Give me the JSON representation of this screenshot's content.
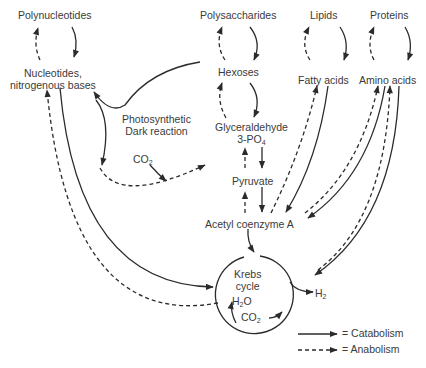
{
  "nodes": {
    "polynucleotides": "Polynucleotides",
    "nucleotides_1": "Nucleotides,",
    "nucleotides_2": "nitrogenous bases",
    "photosynthetic_1": "Photosynthetic",
    "photosynthetic_2": "Dark reaction",
    "co2_left": "CO",
    "co2_left_sub": "2",
    "polysaccharides": "Polysaccharides",
    "lipids": "Lipids",
    "proteins": "Proteins",
    "hexoses": "Hexoses",
    "fatty_acids": "Fatty acids",
    "amino_acids": "Amino acids",
    "glyceraldehyde_1": "Glyceraldehyde",
    "glyceraldehyde_2": "3-PO",
    "glyceraldehyde_sub": "4",
    "pyruvate": "Pyruvate",
    "acetyl_coa": "Acetyl coenzyme A",
    "krebs_1": "Krebs",
    "krebs_2": "cycle",
    "h2o": "H",
    "h2o_sub": "2",
    "h2o_tail": "O",
    "co2_krebs": "CO",
    "co2_krebs_sub": "2",
    "h2": "H",
    "h2_sub": "2"
  },
  "legend": {
    "catabolism": "= Catabolism",
    "anabolism": "= Anabolism"
  },
  "colors": {
    "line": "#2b2b2b",
    "text": "#3a3a3a"
  }
}
